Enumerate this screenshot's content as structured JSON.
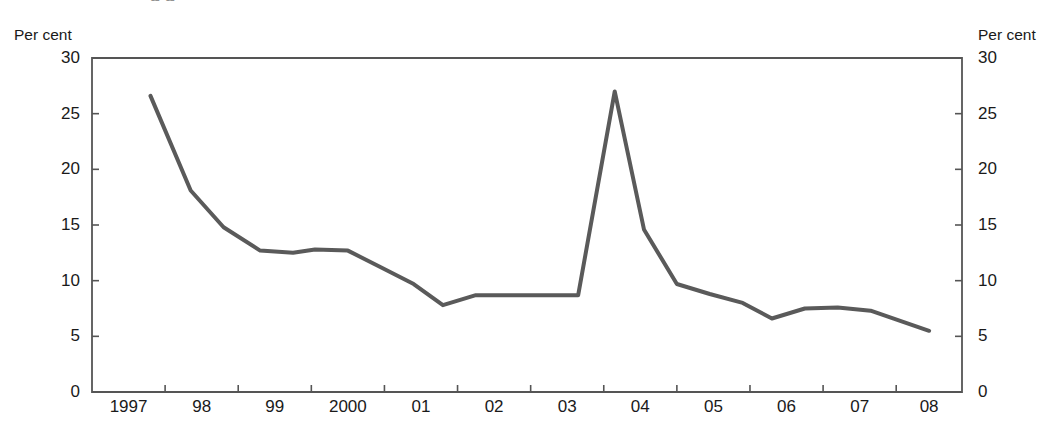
{
  "figure": {
    "title_cut": "g  g",
    "footnote_cut": "",
    "axis_unit_left": "Per cent",
    "axis_unit_right": "Per cent",
    "line_color": "#5a5a5a",
    "frame_color": "#555555",
    "background": "#ffffff"
  },
  "chart_data": {
    "type": "line",
    "title": "",
    "xlabel": "",
    "ylabel": "Per cent",
    "ylim": [
      0,
      30
    ],
    "xlim": [
      1997.0,
      2008.9
    ],
    "grid": false,
    "legend": null,
    "y_ticks": [
      0,
      5,
      10,
      15,
      20,
      25,
      30
    ],
    "y_tick_labels": [
      "0",
      "5",
      "10",
      "15",
      "20",
      "25",
      "30"
    ],
    "x_tick_values": [
      1997,
      1998,
      1999,
      2000,
      2001,
      2002,
      2003,
      2004,
      2005,
      2006,
      2007,
      2008
    ],
    "x_tick_labels": [
      "1997",
      "98",
      "99",
      "2000",
      "01",
      "02",
      "03",
      "04",
      "05",
      "06",
      "07",
      "08"
    ],
    "series": [
      {
        "name": "Per cent",
        "color": "#5a5a5a",
        "x": [
          1997.8,
          1998.35,
          1998.8,
          1999.3,
          1999.75,
          2000.05,
          2000.5,
          2000.95,
          2001.4,
          2001.8,
          2002.25,
          2002.7,
          2003.15,
          2003.65,
          2004.15,
          2004.55,
          2005.0,
          2005.45,
          2005.9,
          2006.3,
          2006.75,
          2007.2,
          2007.65,
          2008.45
        ],
        "y": [
          26.6,
          18.1,
          14.8,
          12.7,
          12.5,
          12.8,
          12.7,
          11.2,
          9.7,
          7.8,
          8.7,
          8.7,
          8.7,
          8.7,
          27.0,
          14.6,
          9.7,
          8.8,
          8.0,
          6.6,
          7.5,
          7.6,
          7.3,
          5.5
        ]
      }
    ]
  }
}
